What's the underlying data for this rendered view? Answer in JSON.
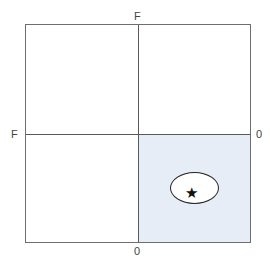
{
  "diagram": {
    "type": "quadrant-grid",
    "labels": {
      "top": "F",
      "left": "F",
      "right": "0",
      "bottom": "0"
    },
    "highlighted_quadrant": "bottom-right",
    "highlight_color": "#e6edf7",
    "marker": {
      "shape": "ellipse",
      "symbol": "★",
      "quadrant": "bottom-right"
    }
  }
}
